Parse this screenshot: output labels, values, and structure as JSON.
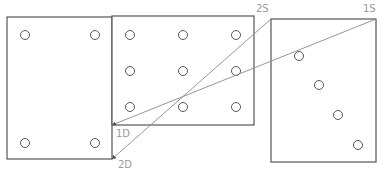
{
  "diagram": {
    "panels": [
      {
        "name": "left-panel",
        "x": 7,
        "y": 17,
        "w": 105,
        "h": 142,
        "holes": [
          [
            25,
            35
          ],
          [
            95,
            35
          ],
          [
            25,
            143
          ],
          [
            95,
            143
          ]
        ]
      },
      {
        "name": "middle-panel",
        "x": 112,
        "y": 16,
        "w": 142,
        "h": 109,
        "holes": [
          [
            130,
            35
          ],
          [
            183,
            35
          ],
          [
            236,
            35
          ],
          [
            130,
            71
          ],
          [
            183,
            71
          ],
          [
            236,
            71
          ],
          [
            130,
            107
          ],
          [
            183,
            107
          ],
          [
            236,
            107
          ]
        ]
      },
      {
        "name": "right-panel",
        "x": 271,
        "y": 19,
        "w": 105,
        "h": 143,
        "holes": [
          [
            299,
            56
          ],
          [
            319,
            85
          ],
          [
            338,
            115
          ],
          [
            358,
            145
          ]
        ]
      }
    ],
    "connectors": [
      {
        "from": "1S",
        "to": "1D",
        "x1": 376,
        "y1": 19,
        "x2": 112,
        "y2": 125
      },
      {
        "from": "2S",
        "to": "2D",
        "x1": 271,
        "y1": 19,
        "x2": 112,
        "y2": 159
      }
    ],
    "labels": {
      "l1S": "1S",
      "l2S": "2S",
      "l1D": "1D",
      "l2D": "2D"
    },
    "colors": {
      "outline": "#555555",
      "connector": "#8a8a8a",
      "label": "#9a9a9a"
    }
  }
}
